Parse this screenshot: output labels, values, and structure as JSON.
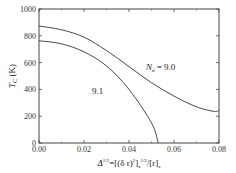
{
  "chart_data": {
    "type": "line",
    "title": "",
    "xlabel": "Δ^1/2=[(δ r)²]ₐ^1/2/[r]ₐ",
    "ylabel": "T_C (K)",
    "xlim": [
      0.0,
      0.08
    ],
    "ylim": [
      0,
      1000
    ],
    "x_ticks": [
      "0.00",
      "0.02",
      "0.04",
      "0.06",
      "0.08"
    ],
    "y_ticks": [
      "0",
      "200",
      "400",
      "600",
      "800",
      "1000"
    ],
    "grid": false,
    "legend": "inline annotations",
    "series": [
      {
        "name": "N_d = 9.0",
        "x": [
          0.0,
          0.01,
          0.02,
          0.03,
          0.04,
          0.05,
          0.06,
          0.07,
          0.078,
          0.08
        ],
        "values": [
          873,
          845,
          790,
          690,
          570,
          450,
          350,
          270,
          235,
          245
        ]
      },
      {
        "name": "9.1",
        "x": [
          0.0,
          0.01,
          0.02,
          0.03,
          0.04,
          0.05,
          0.053
        ],
        "values": [
          763,
          740,
          680,
          575,
          400,
          150,
          0
        ]
      }
    ],
    "annotations": [
      {
        "text": "N_d = 9.0",
        "x": 0.047,
        "y": 600
      },
      {
        "text": "9.1",
        "x": 0.027,
        "y": 380
      }
    ]
  },
  "labels": {
    "y_title_main": "T",
    "y_title_sub": "C",
    "y_title_unit": " (K)",
    "x_title_prefix": "Δ",
    "x_title_sup1": "1/2",
    "x_title_mid": "=[(δ r)",
    "x_title_sup2": "2",
    "x_title_mid2": "]",
    "x_title_sub1": "a",
    "x_title_sup3": "1/2",
    "x_title_mid3": "/[r]",
    "x_title_sub2": "a",
    "ann1_main": "N",
    "ann1_sub": "d",
    "ann1_rest": " = 9.0",
    "ann2": "9.1"
  }
}
